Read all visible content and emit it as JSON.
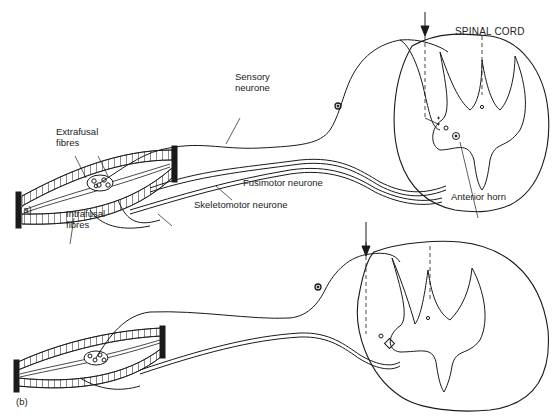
{
  "diagram": {
    "title": "SPINAL CORD",
    "panels": [
      {
        "id": "a",
        "label": "(a)",
        "labels": {
          "extrafusal": "Extrafusal\nfibres",
          "extrafusal_l1": "Extrafusal",
          "extrafusal_l2": "fibres",
          "intrafusal_l1": "Intrafusal",
          "intrafusal_l2": "fibres",
          "sensory_l1": "Sensory",
          "sensory_l2": "neurone",
          "fusimotor": "Fusimotor neurone",
          "skeletomotor": "Skeletomotor neurone",
          "anterior_horn": "Anterior horn"
        }
      },
      {
        "id": "b",
        "label": "(b)"
      }
    ],
    "colors": {
      "ink": "#1a1a1a",
      "background": "#ffffff"
    }
  }
}
